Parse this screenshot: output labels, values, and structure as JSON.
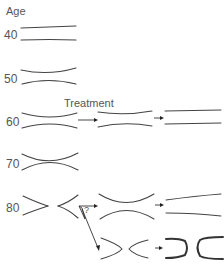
{
  "diagram": {
    "axis_label": "Age",
    "treatment_label": "Treatment",
    "question_mark": "?",
    "rows": [
      {
        "age": "40",
        "shape": "straight-parallel"
      },
      {
        "age": "50",
        "shape": "slight-narrowing"
      },
      {
        "age": "60",
        "shape": "moderate-narrowing",
        "treatment_steps": [
          "improved-narrowing",
          "straight-parallel"
        ]
      },
      {
        "age": "70",
        "shape": "marked-narrowing"
      },
      {
        "age": "80",
        "shape": "occluded-split",
        "treatment_steps": [
          "marked-narrowing",
          "straight-parallel"
        ],
        "alternative_path": [
          "split-bulbs",
          "closed-ends"
        ]
      }
    ],
    "colors": {
      "line": "#444444",
      "text": "#555555"
    }
  }
}
